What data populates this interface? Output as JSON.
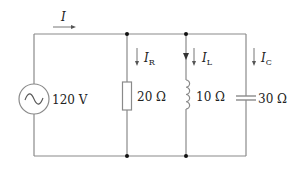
{
  "circuit": {
    "type": "parallel RLC with AC source",
    "source": {
      "label": "120 V",
      "symbol": "ac-source"
    },
    "total_current": {
      "symbol": "I",
      "subscript": ""
    },
    "branches": [
      {
        "component": "resistor",
        "value": "20 Ω",
        "current_symbol": "I",
        "current_subscript": "R"
      },
      {
        "component": "inductor",
        "value": "10 Ω",
        "current_symbol": "I",
        "current_subscript": "L"
      },
      {
        "component": "capacitor",
        "value": "30 Ω",
        "current_symbol": "I",
        "current_subscript": "C"
      }
    ],
    "colors": {
      "wire": "#888888",
      "text": "#222222",
      "node": "#111111"
    }
  }
}
